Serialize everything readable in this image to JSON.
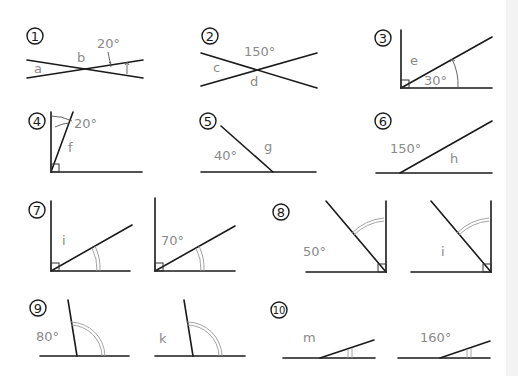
{
  "colors": {
    "line": "#1a1a1a",
    "label": "#8a8a8a",
    "arc": "#9a9a9a",
    "background": "#ffffff"
  },
  "problems": [
    {
      "number": "1",
      "labels": {
        "given": "20°",
        "unknowns": [
          "a",
          "b"
        ]
      }
    },
    {
      "number": "2",
      "labels": {
        "given": "150°",
        "unknowns": [
          "c",
          "d"
        ]
      }
    },
    {
      "number": "3",
      "labels": {
        "given": "30°",
        "unknowns": [
          "e"
        ]
      }
    },
    {
      "number": "4",
      "labels": {
        "given": "20°",
        "unknowns": [
          "f"
        ]
      }
    },
    {
      "number": "5",
      "labels": {
        "given": "40°",
        "unknowns": [
          "g"
        ]
      }
    },
    {
      "number": "6",
      "labels": {
        "given": "150°",
        "unknowns": [
          "h"
        ]
      }
    },
    {
      "number": "7",
      "labels": {
        "left": "i",
        "right": "70°"
      }
    },
    {
      "number": "8",
      "labels": {
        "left": "50°",
        "right": "i"
      }
    },
    {
      "number": "9",
      "labels": {
        "left": "80°",
        "right": "k"
      }
    },
    {
      "number": "10",
      "labels": {
        "left": "m",
        "right": "160°"
      }
    }
  ]
}
